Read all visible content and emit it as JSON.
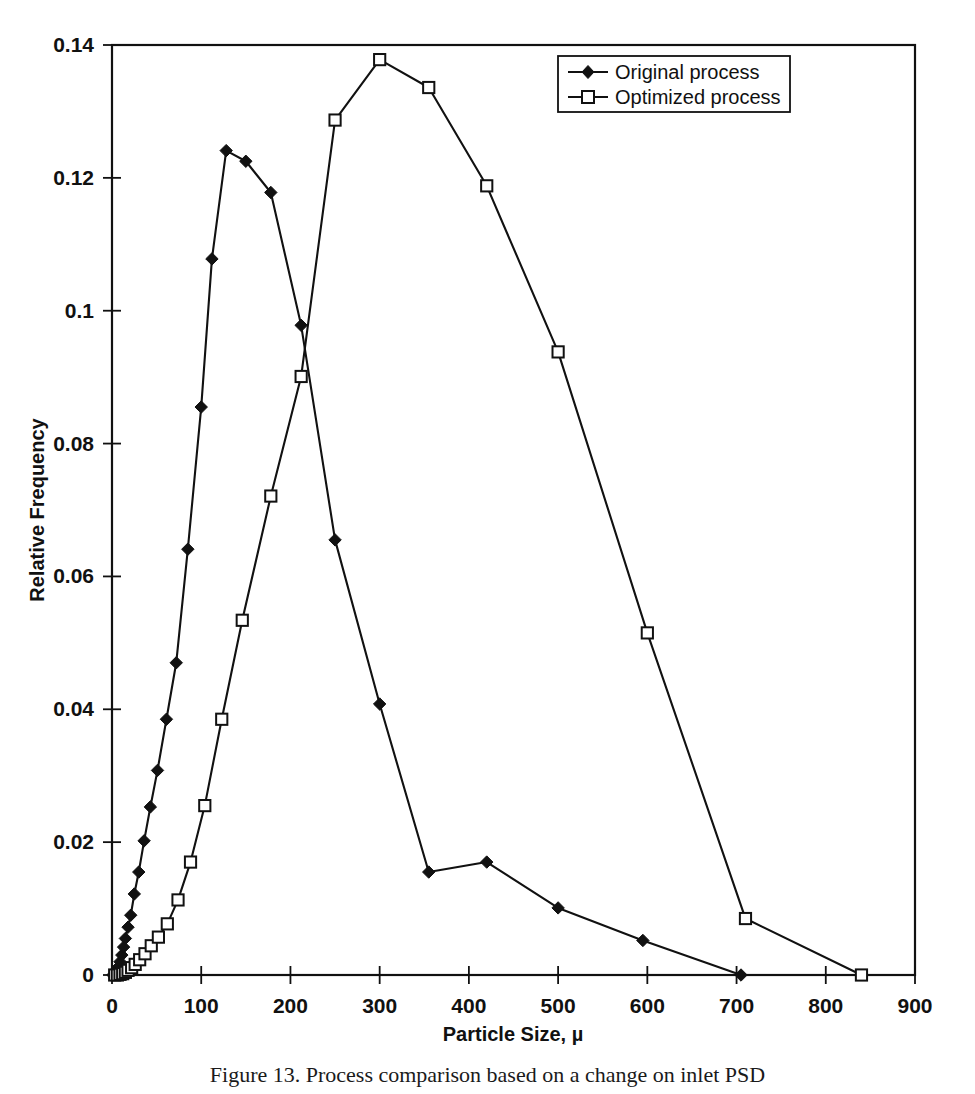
{
  "figure": {
    "caption": "Figure 13.  Process comparison based on a change on inlet PSD",
    "background": "#ffffff",
    "ink_color": "#111111"
  },
  "legend": {
    "position": "top-right",
    "entries": [
      {
        "label": "Original process",
        "marker": "filled-diamond"
      },
      {
        "label": "Optimized process",
        "marker": "open-square"
      }
    ]
  },
  "chart_data": {
    "type": "line",
    "title": "",
    "xlabel": "Particle Size, µ",
    "ylabel": "Relative Frequency",
    "xlim": [
      0,
      900
    ],
    "ylim": [
      0,
      0.14
    ],
    "xticks": [
      0,
      100,
      200,
      300,
      400,
      500,
      600,
      700,
      800,
      900
    ],
    "xtick_labels": [
      "0",
      "100",
      "200",
      "300",
      "400",
      "500",
      "600",
      "700",
      "800",
      "900"
    ],
    "yticks": [
      0,
      0.02,
      0.04,
      0.06,
      0.08,
      0.1,
      0.12,
      0.14
    ],
    "ytick_labels": [
      "0",
      "0.02",
      "0.04",
      "0.06",
      "0.08",
      "0.1",
      "0.12",
      "0.14"
    ],
    "grid": false,
    "legend_position": "top-right",
    "series": [
      {
        "name": "Original process",
        "marker": "filled-diamond",
        "x": [
          1,
          3,
          5,
          7,
          9,
          11,
          13,
          15,
          18,
          21,
          25,
          30,
          36,
          43,
          51,
          61,
          72,
          85,
          100,
          112,
          128,
          150,
          178,
          212,
          250,
          300,
          355,
          420,
          500,
          595,
          705
        ],
        "y": [
          0.0,
          0.0002,
          0.0006,
          0.0012,
          0.002,
          0.003,
          0.0042,
          0.0055,
          0.0072,
          0.009,
          0.0122,
          0.0155,
          0.0202,
          0.0253,
          0.0308,
          0.0385,
          0.047,
          0.0641,
          0.0855,
          0.1078,
          0.1241,
          0.1225,
          0.1178,
          0.0978,
          0.0655,
          0.0408,
          0.0155,
          0.017,
          0.0101,
          0.0052,
          0.0
        ]
      },
      {
        "name": "Optimized process",
        "marker": "open-square",
        "x": [
          3,
          6,
          9,
          12,
          15,
          18,
          22,
          26,
          31,
          37,
          44,
          52,
          62,
          74,
          88,
          104,
          123,
          146,
          178,
          212,
          250,
          300,
          355,
          420,
          500,
          600,
          710,
          840
        ],
        "y": [
          0.0,
          0.0,
          0.0001,
          0.0002,
          0.0004,
          0.0007,
          0.0011,
          0.0016,
          0.0023,
          0.0032,
          0.0044,
          0.0057,
          0.0077,
          0.0113,
          0.017,
          0.0255,
          0.0385,
          0.0534,
          0.0721,
          0.0901,
          0.1287,
          0.1378,
          0.1336,
          0.1188,
          0.0938,
          0.0515,
          0.0085,
          0.0
        ]
      }
    ]
  }
}
